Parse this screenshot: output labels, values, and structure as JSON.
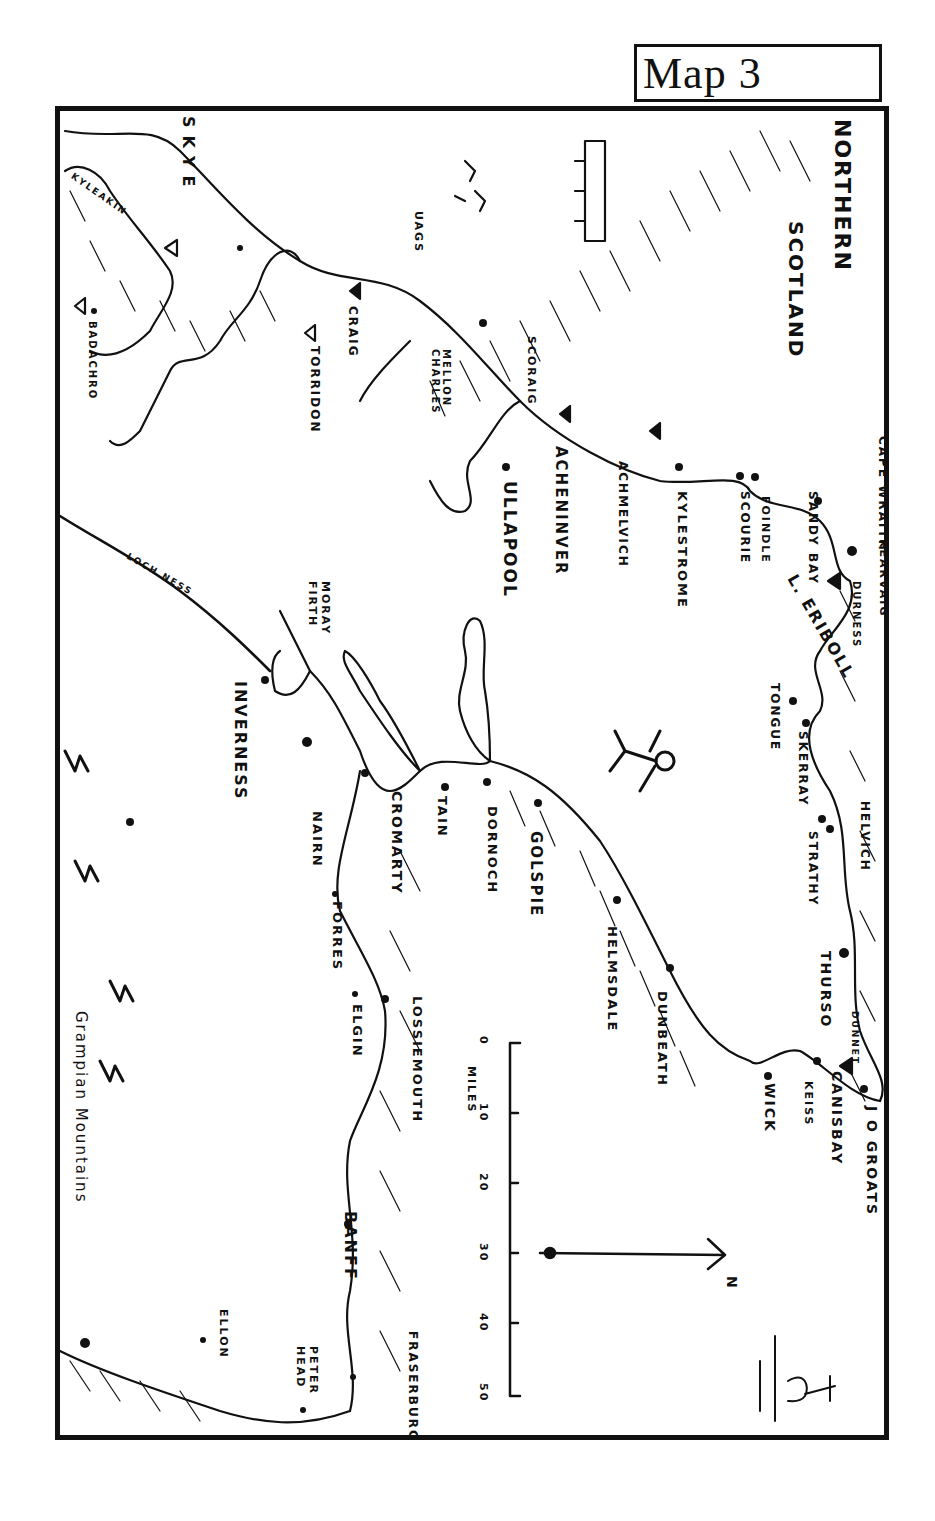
{
  "header": {
    "title": "Map 3"
  },
  "map": {
    "title_line1": "NORTHERN",
    "title_line2": "SCOTLAND",
    "colors": {
      "ink": "#111111",
      "paper": "#ffffff"
    },
    "places": [
      {
        "name": "CAPE WRAITH",
        "type": "cape"
      },
      {
        "name": "KEARVAIG",
        "type": "town"
      },
      {
        "name": "DURNESS",
        "type": "town"
      },
      {
        "name": "SANDY BAY",
        "type": "town"
      },
      {
        "name": "FOINDLE",
        "type": "town"
      },
      {
        "name": "SCOURIE",
        "type": "town"
      },
      {
        "name": "L. ERIBOLL",
        "type": "loch"
      },
      {
        "name": "TONGUE",
        "type": "town"
      },
      {
        "name": "SKERRAY",
        "type": "town"
      },
      {
        "name": "HELVICH",
        "type": "town"
      },
      {
        "name": "STRATHY",
        "type": "town"
      },
      {
        "name": "THURSO",
        "type": "town"
      },
      {
        "name": "DUNNET",
        "type": "hostel"
      },
      {
        "name": "J O GROATS",
        "type": "town"
      },
      {
        "name": "CANISBAY",
        "type": "town"
      },
      {
        "name": "KEISS",
        "type": "town"
      },
      {
        "name": "WICK",
        "type": "town"
      },
      {
        "name": "DUNBEATH",
        "type": "town"
      },
      {
        "name": "HELMSDALE",
        "type": "town"
      },
      {
        "name": "GOLSPIE",
        "type": "town"
      },
      {
        "name": "DORNOCH",
        "type": "town"
      },
      {
        "name": "TAIN",
        "type": "town"
      },
      {
        "name": "CROMARTY",
        "type": "town"
      },
      {
        "name": "NAIRN",
        "type": "town"
      },
      {
        "name": "FORRES",
        "type": "town"
      },
      {
        "name": "ELGIN",
        "type": "town"
      },
      {
        "name": "LOSSIEMOUTH",
        "type": "town"
      },
      {
        "name": "BANFF",
        "type": "town"
      },
      {
        "name": "FRASERBURGH",
        "type": "town"
      },
      {
        "name": "PETER HEAD",
        "type": "town"
      },
      {
        "name": "ELLON",
        "type": "town"
      },
      {
        "name": "INVERNESS",
        "type": "town"
      },
      {
        "name": "MORAY FIRTH",
        "type": "water"
      },
      {
        "name": "LOCH NESS",
        "type": "loch"
      },
      {
        "name": "KYLESTROME",
        "type": "town"
      },
      {
        "name": "ACHMELVICH",
        "type": "hostel"
      },
      {
        "name": "ACHENINVER",
        "type": "hostel"
      },
      {
        "name": "ULLAPOOL",
        "type": "town"
      },
      {
        "name": "SCORAIG",
        "type": "town"
      },
      {
        "name": "MELLON CHARLES",
        "type": "town"
      },
      {
        "name": "CRAIG",
        "type": "hostel"
      },
      {
        "name": "TORRIDON",
        "type": "hostel"
      },
      {
        "name": "UAGS",
        "type": "hostel"
      },
      {
        "name": "KYLEAKIN",
        "type": "hostel"
      },
      {
        "name": "SKYE",
        "type": "island"
      },
      {
        "name": "BADACHRO",
        "type": "town"
      },
      {
        "name": "Grampian Mountains",
        "type": "range"
      }
    ],
    "scale": {
      "unit_label": "MILES",
      "ticks": [
        "0",
        "10",
        "20",
        "30",
        "40",
        "50"
      ]
    },
    "north_arrow": {
      "label": "N"
    }
  }
}
